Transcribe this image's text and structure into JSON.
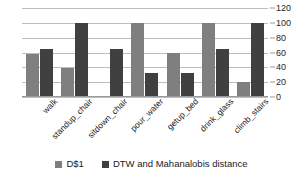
{
  "chart_data": {
    "type": "bar",
    "title": "",
    "xlabel": "",
    "ylabel": "",
    "ylim": [
      0,
      120
    ],
    "yticks": [
      0,
      20,
      40,
      60,
      80,
      100,
      120
    ],
    "grid": true,
    "legend_position": "bottom",
    "categories": [
      "walk",
      "standup_chair",
      "sitdown_chair",
      "pour_water",
      "getup_bed",
      "drink_glass",
      "climb_stairs"
    ],
    "series": [
      {
        "name": "D$1",
        "color": "#7f7f7f",
        "values": [
          58,
          39,
          0,
          100,
          59,
          100,
          20
        ]
      },
      {
        "name": "DTW and Mahanalobis distance",
        "color": "#404040",
        "values": [
          65,
          100,
          65,
          33,
          33,
          65,
          100
        ]
      }
    ]
  },
  "axis": {
    "y_tick_labels": [
      "0",
      "20",
      "40",
      "60",
      "80",
      "100",
      "120"
    ]
  },
  "legend": {
    "items": [
      {
        "label": "D$1",
        "color": "#7f7f7f"
      },
      {
        "label": "DTW and Mahanalobis distance",
        "color": "#404040"
      }
    ]
  },
  "colors": {
    "series_0": "#7f7f7f",
    "series_1": "#404040",
    "gridline": "#bdbdbd",
    "text": "#1a1a1a",
    "background": "#ffffff"
  }
}
